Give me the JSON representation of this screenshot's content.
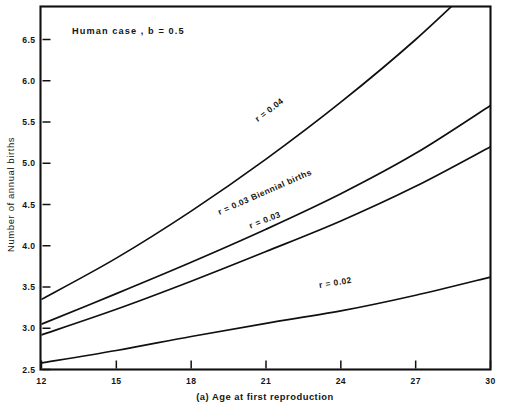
{
  "chart_data": {
    "type": "line",
    "title": "Human  case ,  b = 0.5",
    "caption": "(a) Age at first reproduction",
    "xlabel": "(a) Age at first reproduction",
    "ylabel": "Number of annual births",
    "xlim": [
      12,
      30
    ],
    "ylim": [
      2.5,
      6.9
    ],
    "grid": false,
    "legend_position": "inline-curve-labels",
    "xticks": [
      12,
      15,
      18,
      21,
      24,
      27,
      30
    ],
    "xtick_labels": [
      "12",
      "15",
      "18",
      "21",
      "24",
      "27",
      "30"
    ],
    "yticks": [
      2.5,
      3.0,
      3.5,
      4.0,
      4.5,
      5.0,
      5.5,
      6.0,
      6.5
    ],
    "ytick_labels": [
      "2.5",
      "3.0",
      "3.5",
      "4.0",
      "4.5",
      "5.0",
      "5.5",
      "6.0",
      "6.5"
    ],
    "x": [
      12,
      15,
      18,
      21,
      24,
      27,
      30
    ],
    "series": [
      {
        "name": "r = 0.04",
        "label": "r = 0.04",
        "label_x": 21.2,
        "label_y": 5.62,
        "clipped_at_top": true,
        "values": [
          3.35,
          3.85,
          4.42,
          5.05,
          5.74,
          6.5,
          7.35
        ]
      },
      {
        "name": "r = 0.03 Biennial births",
        "label": "r = 0.03 Biennial births",
        "label_x": 21.0,
        "label_y": 4.62,
        "clipped_at_top": false,
        "values": [
          3.05,
          3.42,
          3.8,
          4.2,
          4.63,
          5.12,
          5.7
        ]
      },
      {
        "name": "r = 0.03",
        "label": "r = 0.03",
        "label_x": 21.0,
        "label_y": 4.28,
        "clipped_at_top": false,
        "values": [
          2.92,
          3.23,
          3.57,
          3.93,
          4.3,
          4.72,
          5.2
        ]
      },
      {
        "name": "r = 0.02",
        "label": "r = 0.02",
        "label_x": 23.8,
        "label_y": 3.52,
        "clipped_at_top": false,
        "values": [
          2.58,
          2.73,
          2.9,
          3.06,
          3.21,
          3.4,
          3.62
        ]
      }
    ]
  },
  "figure": {
    "title": "Human  case ,  b = 0.5",
    "y_axis_title": "Number of annual births",
    "x_axis_caption": "(a) Age at first reproduction",
    "line_color": "#101010",
    "background_color": "#ffffff"
  }
}
